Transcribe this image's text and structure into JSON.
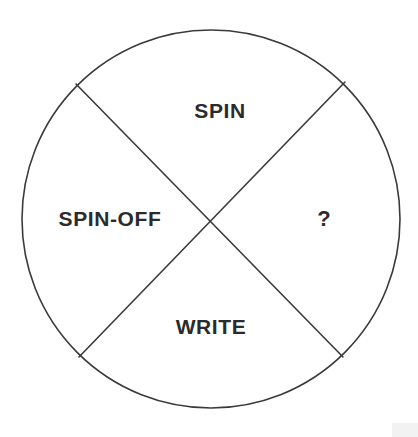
{
  "diagram": {
    "type": "circle-quadrant-wheel",
    "shape_name": "circle",
    "segment_count": 4,
    "colors": {
      "background": "#ffffff",
      "stroke": "#3a3a3a",
      "text": "#2b2b2b"
    },
    "geometry": {
      "center_x": 211,
      "center_y": 219,
      "radius": 189,
      "stroke_width": 1.6,
      "diagonals": [
        {
          "name": "upper-left-to-lower-right",
          "x1": 76,
          "y1": 84,
          "x2": 343,
          "y2": 357
        },
        {
          "name": "upper-right-to-lower-left",
          "x1": 345,
          "y1": 82,
          "x2": 79,
          "y2": 357
        }
      ]
    },
    "segments": [
      {
        "position": "top",
        "label": "SPIN"
      },
      {
        "position": "left",
        "label": "SPIN-OFF"
      },
      {
        "position": "right",
        "label": "?"
      },
      {
        "position": "bottom",
        "label": "WRITE"
      }
    ]
  }
}
